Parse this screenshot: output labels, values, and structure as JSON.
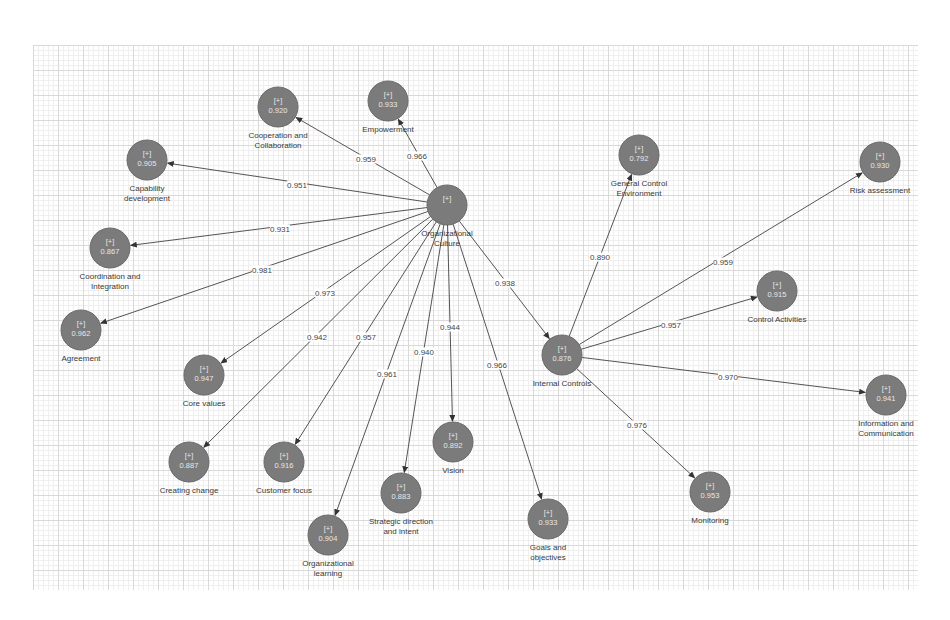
{
  "diagram": {
    "type": "path-model",
    "background": "grid",
    "colors": {
      "node_fill": "#7b7b7b",
      "node_text": "#e8e8e8",
      "edge": "#555555",
      "label_text": "#3a3a3a"
    },
    "nodes": [
      {
        "id": "oc",
        "name": "Organizational Culture",
        "label_lines": [
          "Organizational",
          "Culture"
        ],
        "marker": "[+]",
        "value": "",
        "x": 447,
        "y": 205,
        "r": 20,
        "label_pos": "below"
      },
      {
        "id": "ic",
        "name": "Internal Controls",
        "label_lines": [
          "Internal Controls"
        ],
        "marker": "[+]",
        "value": "0.876",
        "x": 562,
        "y": 355,
        "r": 20,
        "label_pos": "below"
      },
      {
        "id": "cc",
        "name": "Cooperation and Collaboration",
        "label_lines": [
          "Cooperation and",
          "Collaboration"
        ],
        "marker": "[+]",
        "value": "0.920",
        "x": 278,
        "y": 107,
        "r": 20,
        "label_pos": "below"
      },
      {
        "id": "emp",
        "name": "Empowerment",
        "label_lines": [
          "Empowerment"
        ],
        "marker": "[+]",
        "value": "0.933",
        "x": 388,
        "y": 101,
        "r": 20,
        "label_pos": "below"
      },
      {
        "id": "cap",
        "name": "Capability development",
        "label_lines": [
          "Capability",
          "development"
        ],
        "marker": "[+]",
        "value": "0.905",
        "x": 147,
        "y": 160,
        "r": 20,
        "label_pos": "below"
      },
      {
        "id": "coord",
        "name": "Coordination and Integration",
        "label_lines": [
          "Coordination and",
          "Integration"
        ],
        "marker": "[+]",
        "value": "0.867",
        "x": 110,
        "y": 248,
        "r": 20,
        "label_pos": "below"
      },
      {
        "id": "agr",
        "name": "Agreement",
        "label_lines": [
          "Agreement"
        ],
        "marker": "[+]",
        "value": "0.962",
        "x": 81,
        "y": 330,
        "r": 20,
        "label_pos": "below"
      },
      {
        "id": "core",
        "name": "Core values",
        "label_lines": [
          "Core values"
        ],
        "marker": "[+]",
        "value": "0.947",
        "x": 204,
        "y": 375,
        "r": 20,
        "label_pos": "below"
      },
      {
        "id": "chg",
        "name": "Creating change",
        "label_lines": [
          "Creating change"
        ],
        "marker": "[+]",
        "value": "0.887",
        "x": 189,
        "y": 462,
        "r": 20,
        "label_pos": "below"
      },
      {
        "id": "cust",
        "name": "Customer focus",
        "label_lines": [
          "Customer focus"
        ],
        "marker": "[+]",
        "value": "0.916",
        "x": 284,
        "y": 462,
        "r": 20,
        "label_pos": "below"
      },
      {
        "id": "orgl",
        "name": "Organizational learning",
        "label_lines": [
          "Organizational",
          "learning"
        ],
        "marker": "[+]",
        "value": "0.904",
        "x": 328,
        "y": 535,
        "r": 20,
        "label_pos": "below"
      },
      {
        "id": "strat",
        "name": "Strategic direction and intent",
        "label_lines": [
          "Strategic direction",
          "and intent"
        ],
        "marker": "[+]",
        "value": "0.883",
        "x": 401,
        "y": 493,
        "r": 20,
        "label_pos": "below"
      },
      {
        "id": "vis",
        "name": "Vision",
        "label_lines": [
          "Vision"
        ],
        "marker": "[+]",
        "value": "0.892",
        "x": 453,
        "y": 442,
        "r": 20,
        "label_pos": "below"
      },
      {
        "id": "goals",
        "name": "Goals and objectives",
        "label_lines": [
          "Goals and",
          "objectives"
        ],
        "marker": "[+]",
        "value": "0.933",
        "x": 548,
        "y": 519,
        "r": 20,
        "label_pos": "below"
      },
      {
        "id": "gce",
        "name": "General Control Environment",
        "label_lines": [
          "General Control",
          "Environment"
        ],
        "marker": "[+]",
        "value": "0.792",
        "x": 639,
        "y": 155,
        "r": 20,
        "label_pos": "below"
      },
      {
        "id": "risk",
        "name": "Risk assessment",
        "label_lines": [
          "Risk assessment"
        ],
        "marker": "[+]",
        "value": "0.930",
        "x": 880,
        "y": 162,
        "r": 20,
        "label_pos": "below"
      },
      {
        "id": "ca",
        "name": "Control Activities",
        "label_lines": [
          "Control Activities"
        ],
        "marker": "[+]",
        "value": "0.915",
        "x": 777,
        "y": 291,
        "r": 20,
        "label_pos": "below"
      },
      {
        "id": "info",
        "name": "Information and Communication",
        "label_lines": [
          "Information and",
          "Communication"
        ],
        "marker": "[+]",
        "value": "0.941",
        "x": 886,
        "y": 395,
        "r": 20,
        "label_pos": "below"
      },
      {
        "id": "mon",
        "name": "Monitoring",
        "label_lines": [
          "Monitoring"
        ],
        "marker": "[+]",
        "value": "0.953",
        "x": 710,
        "y": 492,
        "r": 20,
        "label_pos": "below"
      }
    ],
    "edges": [
      {
        "from": "oc",
        "to": "cc",
        "value": "0.959",
        "lx": 366,
        "ly": 159
      },
      {
        "from": "oc",
        "to": "emp",
        "value": "0.966",
        "lx": 417,
        "ly": 156
      },
      {
        "from": "oc",
        "to": "cap",
        "value": "0.951",
        "lx": 297,
        "ly": 185
      },
      {
        "from": "oc",
        "to": "coord",
        "value": "0.931",
        "lx": 280,
        "ly": 229
      },
      {
        "from": "oc",
        "to": "agr",
        "value": "0.981",
        "lx": 262,
        "ly": 270
      },
      {
        "from": "oc",
        "to": "core",
        "value": "0.973",
        "lx": 325,
        "ly": 293
      },
      {
        "from": "oc",
        "to": "chg",
        "value": "0.942",
        "lx": 317,
        "ly": 337
      },
      {
        "from": "oc",
        "to": "cust",
        "value": "0.957",
        "lx": 366,
        "ly": 337
      },
      {
        "from": "oc",
        "to": "orgl",
        "value": "0.961",
        "lx": 387,
        "ly": 374
      },
      {
        "from": "oc",
        "to": "strat",
        "value": "0.940",
        "lx": 424,
        "ly": 352
      },
      {
        "from": "oc",
        "to": "vis",
        "value": "0.944",
        "lx": 450,
        "ly": 327
      },
      {
        "from": "oc",
        "to": "goals",
        "value": "0.966",
        "lx": 497,
        "ly": 365
      },
      {
        "from": "oc",
        "to": "ic",
        "value": "0.938",
        "lx": 505,
        "ly": 283
      },
      {
        "from": "ic",
        "to": "gce",
        "value": "0.890",
        "lx": 600,
        "ly": 257
      },
      {
        "from": "ic",
        "to": "risk",
        "value": "0.959",
        "lx": 723,
        "ly": 262
      },
      {
        "from": "ic",
        "to": "ca",
        "value": "0.957",
        "lx": 671,
        "ly": 325
      },
      {
        "from": "ic",
        "to": "info",
        "value": "0.970",
        "lx": 728,
        "ly": 377
      },
      {
        "from": "ic",
        "to": "mon",
        "value": "0.976",
        "lx": 637,
        "ly": 425
      }
    ]
  }
}
